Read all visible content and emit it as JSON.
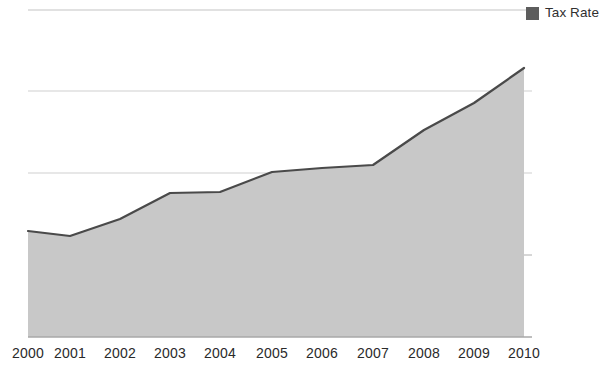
{
  "legend": {
    "position": "top-right",
    "entries": [
      {
        "label": "Tax Rate",
        "swatch_icon": "legend-swatch-icon",
        "color": "#5d5d5d"
      }
    ]
  },
  "axis": {
    "x_tick_labels": [
      "2000",
      "2001",
      "2002",
      "2003",
      "2004",
      "2005",
      "2006",
      "2007",
      "2008",
      "2009",
      "2010"
    ],
    "first_label_clipped": true,
    "y_tick_labels": [],
    "grid": "horizontal"
  },
  "style": {
    "background": "#ffffff",
    "area_fill": "#c8c8c8",
    "line_color": "#4a4a4a",
    "gridline_color": "#c0c0c0",
    "baseline_color": "#a9a9a9",
    "label_color": "#2a2a2a"
  },
  "chart_data": {
    "type": "area",
    "title": "",
    "subtitle": "",
    "xlabel": "",
    "ylabel": "",
    "categories": [
      "2000",
      "2001",
      "2002",
      "2003",
      "2004",
      "2005",
      "2006",
      "2007",
      "2008",
      "2009",
      "2010"
    ],
    "series": [
      {
        "name": "Tax Rate",
        "color": "#c8c8c8",
        "values": [
          1.3,
          1.24,
          1.44,
          1.76,
          1.77,
          2.02,
          2.07,
          2.1,
          2.53,
          2.86,
          3.29
        ]
      }
    ],
    "ylim": [
      0,
      4.0
    ],
    "xlim": [
      "2000",
      "2010"
    ],
    "gridlines_y": [
      1.0,
      2.0,
      3.0,
      4.0
    ],
    "grid": true,
    "legend_position": "top-right",
    "annotations": []
  },
  "geometry": {
    "plot_left": 28,
    "plot_right": 524,
    "plot_top": 10,
    "plot_bottom": 337,
    "grid_y_px": [
      10,
      91,
      173,
      255
    ],
    "point_x_px": [
      28,
      70,
      120,
      170,
      220,
      272,
      322,
      373,
      424,
      474,
      524
    ],
    "point_y_px": [
      231,
      236,
      219,
      193,
      192,
      172,
      168,
      165,
      130,
      103,
      68
    ],
    "gridline_extend_right_px": 532
  }
}
